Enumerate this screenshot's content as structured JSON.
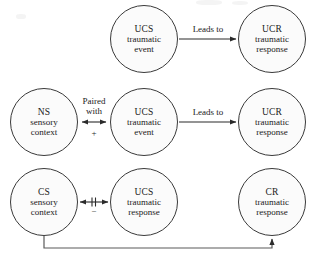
{
  "diagram": {
    "stroke_color": "#3a3a3a",
    "node_fill": "#fbfbfb",
    "text_color": "#1a1a1a",
    "rows": [
      {
        "name": "unconditioned",
        "nodes": [
          {
            "id": "ucs-top",
            "line1": "UCS",
            "line2": "traumatic",
            "line3": "event"
          },
          {
            "id": "ucr-top",
            "line1": "UCR",
            "line2": "traumatic",
            "line3": "response"
          }
        ],
        "connector": {
          "label": "Leads to",
          "sign": "",
          "type": "single-arrow"
        }
      },
      {
        "name": "pairing",
        "nodes": [
          {
            "id": "ns-mid",
            "line1": "NS",
            "line2": "sensory",
            "line3": "context"
          },
          {
            "id": "ucs-mid",
            "line1": "UCS",
            "line2": "traumatic",
            "line3": "event"
          },
          {
            "id": "ucr-mid",
            "line1": "UCR",
            "line2": "traumatic",
            "line3": "response"
          }
        ],
        "connector_left": {
          "label_line1": "Paired",
          "label_line2": "with",
          "sign": "+",
          "type": "double-arrow"
        },
        "connector_right": {
          "label": "Leads to",
          "sign": "",
          "type": "single-arrow"
        }
      },
      {
        "name": "conditioned",
        "nodes": [
          {
            "id": "cs-bot",
            "line1": "CS",
            "line2": "sensory",
            "line3": "context"
          },
          {
            "id": "ucs-bot",
            "line1": "UCS",
            "line2": "traumatic",
            "line3": "response"
          },
          {
            "id": "cr-bot",
            "line1": "CR",
            "line2": "traumatic",
            "line3": "response"
          }
        ],
        "connector_left": {
          "label": "",
          "mark": "‖",
          "sign": "–",
          "type": "double-arrow-blocked"
        }
      }
    ],
    "feedback": {
      "from": "cs-bot",
      "to": "cr-bot",
      "label": ""
    }
  }
}
